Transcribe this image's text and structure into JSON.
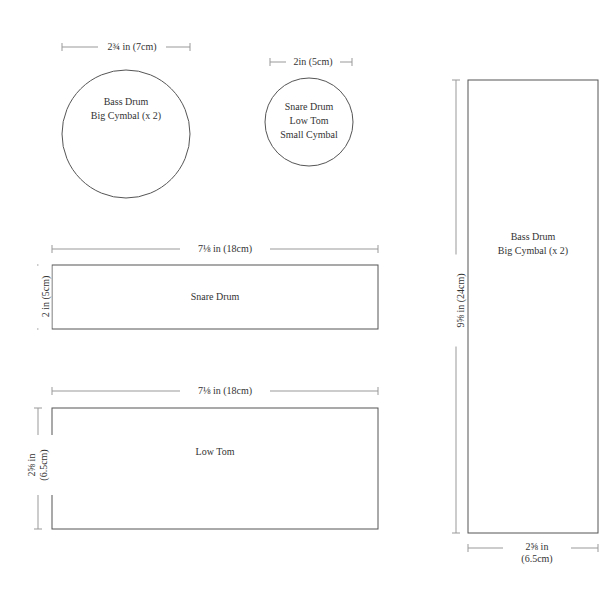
{
  "templates": [
    {
      "id": "circle-large",
      "shape": "circle",
      "dimension_label": "2¾ in (7cm)",
      "content_lines": [
        "Bass Drum",
        "Big Cymbal (x 2)"
      ]
    },
    {
      "id": "circle-small",
      "shape": "circle",
      "dimension_label": "2in (5cm)",
      "content_lines": [
        "Snare Drum",
        "Low Tom",
        "Small Cymbal"
      ]
    },
    {
      "id": "rect-snare",
      "shape": "rectangle",
      "width_label": "7⅛ in (18cm)",
      "height_label": "2 in (5cm)",
      "content_lines": [
        "Snare Drum"
      ]
    },
    {
      "id": "rect-low-tom",
      "shape": "rectangle",
      "width_label": "7⅛ in (18cm)",
      "height_label_lines": [
        "2⅝ in",
        "(6.5cm)"
      ],
      "content_lines": [
        "Low Tom"
      ]
    },
    {
      "id": "rect-bass",
      "shape": "rectangle",
      "height_label": "9⅝ in (24cm)",
      "width_label_lines": [
        "2⅝ in",
        "(6.5cm)"
      ],
      "content_lines": [
        "Bass Drum",
        "Big Cymbal (x 2)"
      ]
    }
  ],
  "colors": {
    "outline": "#555555",
    "dimension_line": "#999999",
    "text": "#333333",
    "background": "#ffffff"
  }
}
